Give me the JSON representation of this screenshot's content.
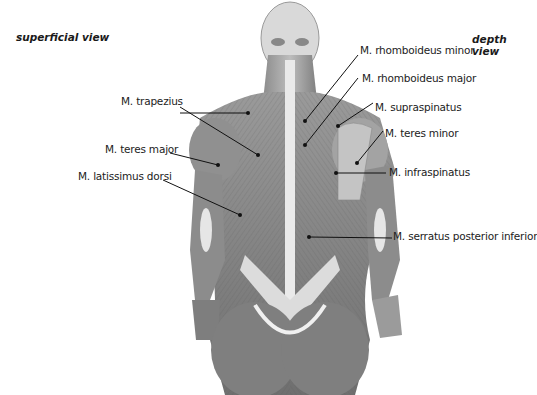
{
  "header": {
    "cut_title": "superficial and deep layers"
  },
  "views": {
    "left": "superficial view",
    "right": "depth view"
  },
  "labels": {
    "trapezius": "M. trapezius",
    "teres_major": "M. teres major",
    "latissimus_dorsi": "M. latissimus dorsi",
    "rhomboideus_minor": "M. rhomboideus minor",
    "rhomboideus_major": "M. rhomboideus major",
    "supraspinatus": "M. supraspinatus",
    "teres_minor": "M. teres minor",
    "infraspinatus": "M. infraspinatus",
    "serratus_posterior_inferior": "M. serratus posterior inferior"
  },
  "colors": {
    "ink": "#222222",
    "muscle_dark": "#6e6e6e",
    "muscle_light": "#c8c8c8",
    "tendon": "#ececec"
  }
}
